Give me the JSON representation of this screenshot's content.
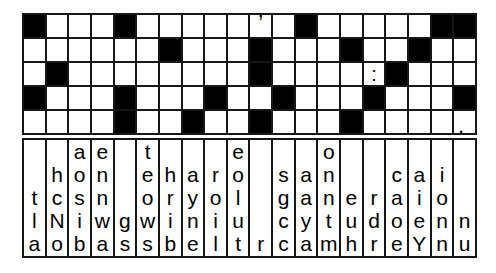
{
  "puzzle": {
    "type": "fallen-phrases-word-puzzle",
    "grid": {
      "rows": 5,
      "cols": 20,
      "legend": {
        "#": "black-cell",
        ".": "empty-white-cell",
        "'": "apostrophe",
        ":": "colon",
        "*": "period"
      },
      "cells": [
        "#...#.....'.#.....##",
        "......#...#...#..#..",
        ".#........#....:#...",
        "#...#...#..#...#...#",
        "....#..#..#...#....*"
      ]
    },
    "punctuation": {
      "apostrophe": "’",
      "colon": ":",
      "period": "."
    },
    "letter_columns": [
      [
        "t",
        "l",
        "a"
      ],
      [
        "h",
        "c",
        "N",
        "o"
      ],
      [
        "a",
        "o",
        "s",
        "i",
        "b"
      ],
      [
        "e",
        "n",
        "n",
        "w",
        "a"
      ],
      [
        "g",
        "s"
      ],
      [
        "t",
        "e",
        "o",
        "w",
        "s"
      ],
      [
        "h",
        "r",
        "i",
        "b"
      ],
      [
        "a",
        "y",
        "n",
        "e"
      ],
      [
        "r",
        "o",
        "i",
        "l"
      ],
      [
        "e",
        "o",
        "l",
        "u",
        "t"
      ],
      [
        "r"
      ],
      [
        "s",
        "g",
        "c",
        "c"
      ],
      [
        "a",
        "a",
        "y",
        "a"
      ],
      [
        "o",
        "n",
        "n",
        "t",
        "m"
      ],
      [
        "e",
        "u",
        "h"
      ],
      [
        "r",
        "d",
        "r"
      ],
      [
        "c",
        "a",
        "o",
        "e"
      ],
      [
        "a",
        "i",
        "e",
        "Y"
      ],
      [
        "i",
        "o",
        "n",
        "n"
      ],
      [
        "n",
        "u"
      ]
    ],
    "colors": {
      "background": "#ffffff",
      "line": "#171717",
      "black_cell": "#000000",
      "white_cell": "#ffffff",
      "text": "#000000"
    }
  }
}
